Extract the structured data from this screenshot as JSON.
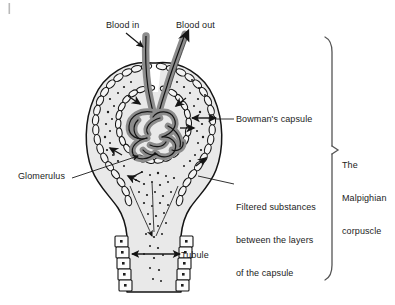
{
  "diagram": {
    "title": "The Malpighian corpuscle",
    "labels": {
      "blood_in": "Blood in",
      "blood_out": "Blood out",
      "bowmans_capsule": "Bowman's capsule",
      "glomerulus": "Glomerulus",
      "filtered_line1": "Filtered substances",
      "filtered_line2": "between the layers",
      "filtered_line3": "of the capsule",
      "tubule": "Tubule",
      "malpighian_line1": "The",
      "malpighian_line2": "Malpighian",
      "malpighian_line3": "corpuscle"
    },
    "colors": {
      "background": "#ffffff",
      "ink": "#1b1b1b",
      "vessel_fill": "#8c8c8c",
      "capsule_space": "#e9e9e9",
      "capsule_cell_fill": "#f4f4f4",
      "bracket": "#555555",
      "corner_tick": "#b9b9b9"
    },
    "structures": [
      "afferent arteriole",
      "efferent arteriole",
      "glomerulus capillary knot",
      "bowman's capsule outer layer",
      "bowman's capsule inner layer",
      "capsular space with filtered substances",
      "renal tubule"
    ]
  }
}
